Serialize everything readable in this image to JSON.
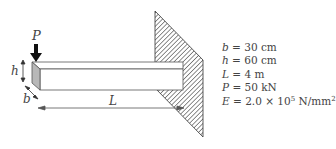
{
  "figure": {
    "type": "cantilever-beam",
    "labels": {
      "load": "P",
      "height": "h",
      "width": "b",
      "length": "L"
    }
  },
  "parameters": [
    {
      "symbol": "b",
      "eq": "= 30 cm"
    },
    {
      "symbol": "h",
      "eq": "= 60 cm"
    },
    {
      "symbol": "L",
      "eq": "= 4 m"
    },
    {
      "symbol": "P",
      "eq": "= 50 kN"
    },
    {
      "symbol": "E",
      "eq": "= 2.0 × 10",
      "exp": "5",
      "unit": " N/mm",
      "unit_exp": "2"
    }
  ],
  "colors": {
    "line": "#444444",
    "hatch": "#333333",
    "end_face": "#b8b8b8",
    "arrow": "#111111"
  }
}
